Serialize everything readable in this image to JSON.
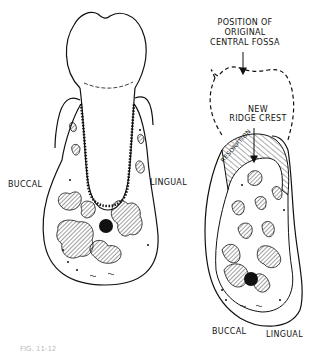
{
  "figure": {
    "caption_partial": "FIG. 11-12",
    "left_panel": {
      "labels": {
        "buccal": "BUCCAL",
        "lingual": "LINGUAL"
      }
    },
    "right_panel": {
      "labels": {
        "position_line1": "POSITION OF",
        "position_line2": "ORIGINAL",
        "position_line3": "CENTRAL FOSSA",
        "new_ridge_line1": "NEW",
        "new_ridge_line2": "RIDGE CREST",
        "resorption": "RESORPTION",
        "buccal": "BUCCAL",
        "lingual": "LINGUAL"
      }
    },
    "colors": {
      "ink": "#111111",
      "background": "#ffffff"
    }
  }
}
